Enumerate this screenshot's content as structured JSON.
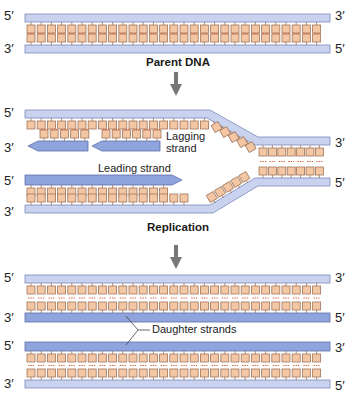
{
  "panels": [
    {
      "caption": "Parent DNA",
      "labels": {
        "top_left": "5′",
        "bottom_left": "3′",
        "top_right": "3′",
        "bottom_right": "5′"
      }
    },
    {
      "caption": "Replication",
      "labels": {
        "top_left": "5′",
        "lagging_left": "3′",
        "leading_left": "5′",
        "bottom_left": "3′",
        "top_right": "3′",
        "bottom_right": "5′"
      },
      "annotations": {
        "lagging": "Lagging\nstrand",
        "lagging_line1": "Lagging",
        "lagging_line2": "strand",
        "leading": "Leading strand"
      }
    },
    {
      "caption": "",
      "labels": {
        "a_left": "5′",
        "b_left": "3′",
        "c_left": "5′",
        "d_left": "3′",
        "a_right": "3′",
        "b_right": "5′",
        "c_right": "3′",
        "d_right": "5′"
      },
      "annotations": {
        "daughter": "Daughter strands"
      }
    }
  ],
  "colors": {
    "parent_strand": "#c9d3ef",
    "parent_strand_border": "#7d89b8",
    "daughter_strand": "#8fa3dc",
    "daughter_strand_border": "#5f70a8",
    "base_fill": "#f3c6a4",
    "base_border": "#a0765a",
    "hbond": "#d9603a",
    "arrow": "#777777"
  }
}
